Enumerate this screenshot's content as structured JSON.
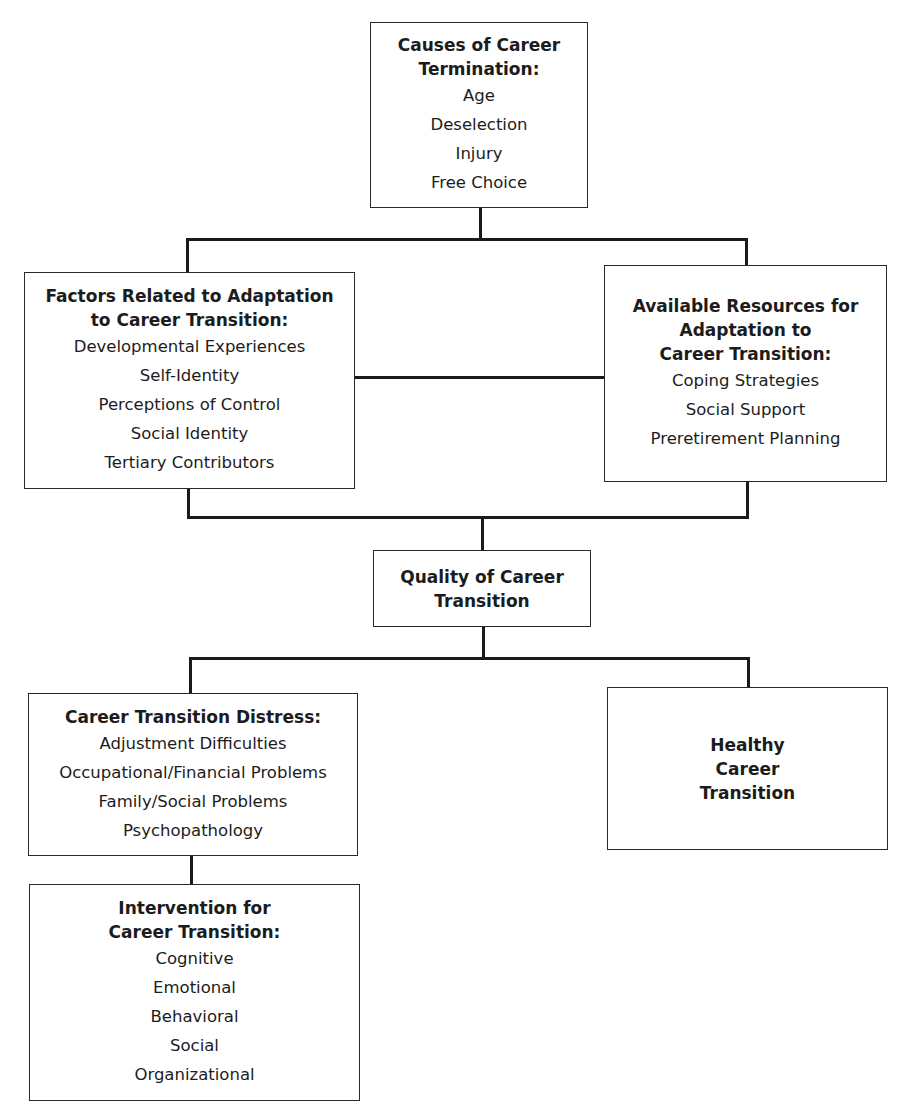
{
  "diagram": {
    "causes": {
      "title": "Causes of Career Termination:",
      "title_lines": [
        "Causes of Career",
        "Termination:"
      ],
      "items": [
        "Age",
        "Deselection",
        "Injury",
        "Free Choice"
      ]
    },
    "factors": {
      "title_lines": [
        "Factors Related to Adaptation",
        "to Career Transition:"
      ],
      "items": [
        "Developmental Experiences",
        "Self-Identity",
        "Perceptions of Control",
        "Social Identity",
        "Tertiary Contributors"
      ]
    },
    "resources": {
      "title_lines": [
        "Available Resources for",
        "Adaptation to",
        "Career Transition:"
      ],
      "items": [
        "Coping Strategies",
        "Social Support",
        "Preretirement Planning"
      ]
    },
    "quality": {
      "title_lines": [
        "Quality of Career",
        "Transition"
      ]
    },
    "distress": {
      "title_lines": [
        "Career Transition Distress:"
      ],
      "items": [
        "Adjustment Difficulties",
        "Occupational/Financial Problems",
        "Family/Social Problems",
        "Psychopathology"
      ]
    },
    "healthy": {
      "title_lines": [
        "Healthy",
        "Career",
        "Transition"
      ]
    },
    "intervention": {
      "title_lines": [
        "Intervention for",
        "Career Transition:"
      ],
      "items": [
        "Cognitive",
        "Emotional",
        "Behavioral",
        "Social",
        "Organizational"
      ]
    }
  }
}
